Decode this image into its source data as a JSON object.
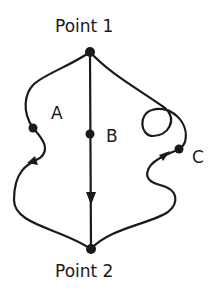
{
  "diagram": {
    "start_label": "Point 1",
    "end_label": "Point 2",
    "paths": [
      {
        "id": "A",
        "label": "A",
        "shape": "curved, left side"
      },
      {
        "id": "B",
        "label": "B",
        "shape": "straight, vertical with arrow"
      },
      {
        "id": "C",
        "label": "C",
        "shape": "curved with loop, right side"
      }
    ],
    "colors": {
      "stroke": "#1a1a1a",
      "background": "#ffffff"
    }
  }
}
